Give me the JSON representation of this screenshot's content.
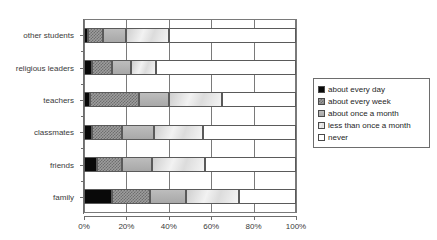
{
  "top_caption": "",
  "chart_data": {
    "type": "bar",
    "orientation": "horizontal",
    "stacked": true,
    "normalized": true,
    "title": "",
    "xlabel": "",
    "ylabel": "",
    "xlim": [
      0,
      100
    ],
    "grid": true,
    "legend_position": "right",
    "xticks": [
      0,
      20,
      40,
      60,
      80,
      100
    ],
    "xticklabels": [
      "0%",
      "20%",
      "40%",
      "60%",
      "80%",
      "100%"
    ],
    "categories": [
      "other students",
      "religious leaders",
      "teachers",
      "classmates",
      "friends",
      "family"
    ],
    "series": [
      {
        "name": "about every day",
        "swatch": "#090909",
        "values": [
          2,
          4,
          3,
          4,
          6,
          13
        ]
      },
      {
        "name": "about every week",
        "swatch": "#9d9d9d",
        "values": [
          7,
          9,
          23,
          14,
          12,
          18
        ]
      },
      {
        "name": "about once a month",
        "swatch": "#b3b3b3",
        "values": [
          11,
          9,
          14,
          15,
          14,
          17
        ]
      },
      {
        "name": "less than once a month",
        "swatch": "#e2e2e2",
        "values": [
          20,
          12,
          25,
          23,
          25,
          25
        ]
      },
      {
        "name": "never",
        "swatch": "#ffffff",
        "values": [
          60,
          66,
          35,
          44,
          43,
          27
        ]
      }
    ]
  },
  "legend": {
    "items": [
      "about every day",
      "about every week",
      "about once a month",
      "less than once a month",
      "never"
    ]
  }
}
